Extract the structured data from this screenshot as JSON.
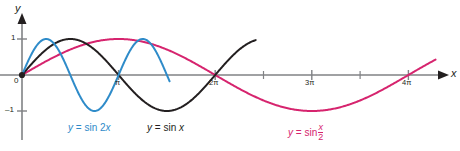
{
  "figure": {
    "title": "",
    "axes": {
      "x_name": "x",
      "y_name": "y"
    },
    "ticks": {
      "x": [
        "π",
        "2π",
        "3π",
        "4π"
      ],
      "y": [
        "1",
        "0",
        "–1"
      ]
    },
    "labels": {
      "origin": "0",
      "y_one": "1",
      "y_neg_one": "–1",
      "x_pi": "π",
      "x_2pi": "2π",
      "x_3pi": "3π",
      "x_4pi": "4π"
    },
    "curve_labels": {
      "blue": {
        "lhs": "y",
        "eq": "=",
        "rhs": "sin 2x"
      },
      "black": {
        "lhs": "y",
        "eq": "=",
        "rhs": "sin x"
      },
      "pink": {
        "lhs": "y",
        "eq": "=",
        "rhs": "sin",
        "num": "x",
        "den": "2"
      }
    },
    "colors": {
      "blue": "#2e8bc9",
      "black": "#231f20",
      "pink": "#d6246e",
      "axis": "#808285"
    }
  },
  "chart_data": {
    "type": "line",
    "title": "",
    "xlabel": "x",
    "ylabel": "y",
    "xlim": [
      0,
      13.6
    ],
    "ylim": [
      -1.35,
      1.35
    ],
    "grid": false,
    "legend": "inline-annotations",
    "x_ticks": [
      3.14159,
      6.28319,
      9.42478,
      12.56637
    ],
    "x_tick_labels": [
      "π",
      "2π",
      "3π",
      "4π"
    ],
    "y_ticks": [
      1,
      0,
      -1
    ],
    "y_tick_labels": [
      "1",
      "0",
      "–1"
    ],
    "series": [
      {
        "name": "y = sin 2x",
        "color": "#2e8bc9",
        "amplitude": 1,
        "period": 3.14159,
        "formula": "sin(2x)",
        "x_domain": [
          0,
          4.8
        ],
        "key_points": [
          {
            "x": 0,
            "y": 0
          },
          {
            "x": 0.785,
            "y": 1
          },
          {
            "x": 1.571,
            "y": 0
          },
          {
            "x": 2.356,
            "y": -1
          },
          {
            "x": 3.142,
            "y": 0
          },
          {
            "x": 3.6,
            "y": 0.88
          }
        ]
      },
      {
        "name": "y = sin x",
        "color": "#231f20",
        "amplitude": 1,
        "period": 6.28319,
        "formula": "sin(x)",
        "x_domain": [
          0,
          7.6
        ],
        "key_points": [
          {
            "x": 0,
            "y": 0
          },
          {
            "x": 1.571,
            "y": 1
          },
          {
            "x": 3.142,
            "y": 0
          },
          {
            "x": 4.712,
            "y": -1
          },
          {
            "x": 6.283,
            "y": 0
          },
          {
            "x": 7.3,
            "y": 0.86
          }
        ]
      },
      {
        "name": "y = sin x/2",
        "color": "#d6246e",
        "amplitude": 1,
        "period": 12.56637,
        "formula": "sin(x/2)",
        "x_domain": [
          0,
          13.45
        ],
        "key_points": [
          {
            "x": 0,
            "y": 0
          },
          {
            "x": 3.142,
            "y": 1
          },
          {
            "x": 6.283,
            "y": 0
          },
          {
            "x": 9.425,
            "y": -1
          },
          {
            "x": 12.566,
            "y": 0
          },
          {
            "x": 13.45,
            "y": 0.43
          }
        ]
      }
    ]
  }
}
